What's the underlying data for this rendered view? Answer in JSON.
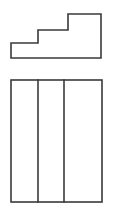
{
  "figure": {
    "background_color": "#ffffff",
    "line_color": "#3a3a3a",
    "line_width": 1.6,
    "canvas": {
      "width": 123,
      "height": 209
    },
    "shapes": [
      {
        "name": "staircase-outline",
        "kind": "polygon",
        "label": "Staircase step profile",
        "fill": "#ffffff",
        "stroke": "#3a3a3a",
        "points": "11,43 38,43 38,30 68,30 68,14 101,14 101,58 11,58",
        "step_count": 3,
        "steps": [
          {
            "name": "step-low",
            "x1": 11,
            "x2": 38,
            "top_y": 43
          },
          {
            "name": "step-middle",
            "x1": 38,
            "x2": 68,
            "top_y": 30
          },
          {
            "name": "step-high",
            "x1": 68,
            "x2": 101,
            "top_y": 14
          }
        ],
        "base_y": 58
      },
      {
        "name": "panel-rectangle-outline",
        "kind": "rect",
        "label": "Three-panel rectangle",
        "fill": "#ffffff",
        "stroke": "#3a3a3a",
        "x": 11,
        "y": 80,
        "width": 91,
        "height": 122
      }
    ],
    "dividers": [
      {
        "name": "divider-1",
        "x": 38,
        "y1": 80,
        "y2": 202
      },
      {
        "name": "divider-2",
        "x": 64,
        "y1": 80,
        "y2": 202
      }
    ],
    "panels": [
      {
        "name": "panel-left",
        "x1": 11,
        "x2": 38
      },
      {
        "name": "panel-middle",
        "x1": 38,
        "x2": 64
      },
      {
        "name": "panel-right",
        "x1": 64,
        "x2": 102
      }
    ]
  }
}
